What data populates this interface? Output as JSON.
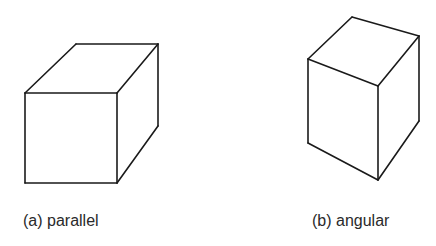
{
  "figures": [
    {
      "id": "a",
      "caption": "(a) parallel",
      "projection": "parallel",
      "edges": [
        [
          25,
          93,
          117,
          93
        ],
        [
          117,
          93,
          117,
          183
        ],
        [
          117,
          183,
          25,
          183
        ],
        [
          25,
          183,
          25,
          93
        ],
        [
          25,
          93,
          76,
          44
        ],
        [
          76,
          44,
          158,
          44
        ],
        [
          158,
          44,
          117,
          93
        ],
        [
          158,
          44,
          158,
          126
        ],
        [
          158,
          126,
          117,
          183
        ]
      ]
    },
    {
      "id": "b",
      "caption": "(b) angular",
      "projection": "angular",
      "edges": [
        [
          308,
          59,
          352,
          17
        ],
        [
          352,
          17,
          419,
          36
        ],
        [
          419,
          36,
          378,
          86
        ],
        [
          378,
          86,
          308,
          59
        ],
        [
          308,
          59,
          308,
          143
        ],
        [
          308,
          143,
          378,
          180
        ],
        [
          378,
          180,
          378,
          86
        ],
        [
          378,
          180,
          419,
          121
        ],
        [
          419,
          121,
          419,
          36
        ]
      ]
    }
  ],
  "style": {
    "stroke": "#1a1a1a",
    "stroke_width": 1.6,
    "text_color": "#2a2a2a",
    "background": "#ffffff"
  }
}
